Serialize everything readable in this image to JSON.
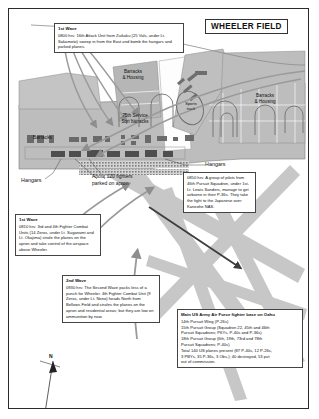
{
  "title": {
    "text": "WHEELER FIELD"
  },
  "map_labels": {
    "barracks_housing_left": "Barracks\n& Housing",
    "barracks_housing_right": "Barracks\n& Housing",
    "service_sqn": "75th Service\nSqn barracks",
    "sports_track": "Sports\ntrack",
    "barracks_row": "Barracks",
    "hangars_right": "Hangars",
    "hangars_left": "Hangars",
    "apron_note": "About 120 fighters\nparked on apron",
    "compass_north": "N"
  },
  "callouts": [
    {
      "id": "first-wave-0800",
      "heading": "1st Wave",
      "body": "0800 hrs: 16th Attack Unit from Zuikaku (25 Vals, under Lt. Sakamoto) sweep in from the East and bomb the hangars and parked planes."
    },
    {
      "id": "first-wave-0810",
      "heading": "1st Wave",
      "body": "0810 hrs: 3rd and 4th Fighter Combat Units (14 Zeros, under Lt. Suganami and Lt. Okajima) strafe the planes on the apron and take control of the airspace above Wheeler."
    },
    {
      "id": "second-wave-0930",
      "heading": "2nd Wave",
      "body": "0930 hrs: The Second Wave packs less of a punch for Wheeler. 4th Fighter Combat Unit (9 Zeros, under Lt. Nono) heads North from Bellows Field and strafes the planes on the apron and residential areas; but they are low on ammunition by now."
    },
    {
      "id": "pilots-airborne-0850",
      "heading": "",
      "body": "0850 hrs: A group of pilots from 46th Pursuit Squadron, under 1st-Lt. Lewis Sanders, manage to get airborne in their P-36s. They take the fight to the Japanese over Kaneohe NAS."
    }
  ],
  "base_info": {
    "heading": "Main US Army Air Force fighter base on Oahu",
    "lines": [
      "14th Pursuit Wing (P-26s)",
      "15th Pursuit Group (Squadron 22, 45th and 46th",
      "   Pursuit Squadrons; P6Ys, P-40s and P-36s)",
      "18th Pursuit Group (6th, 19th, 73rd and 78th",
      "   Pursuit Squadrons; P-40s)",
      "Total 140 US planes present (87 P-40s, 12 P-26s,",
      "3 PBYs, 35 P-36s, 3 Obs.); 40 destroyed, 53 put",
      "out of commission."
    ]
  },
  "colors": {
    "runway_fill": "#c9c9c9",
    "ground_fill": "#bdbdbd",
    "building_fill": "#8d8d8d",
    "outline": "#555555",
    "arrow": "#8e8e8e",
    "arrow_dark": "#4a4a4a",
    "frame": "#2b2b2b"
  }
}
